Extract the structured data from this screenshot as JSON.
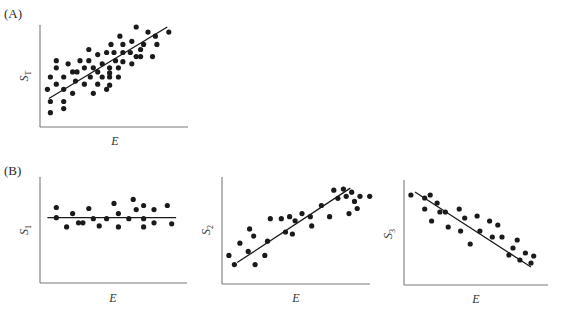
{
  "figure": {
    "panel_A_label": "(A)",
    "panel_B_label": "(B)"
  },
  "chart_data": [
    {
      "type": "scatter",
      "panel": "A",
      "title": "",
      "xlabel": "E",
      "ylabel": "S",
      "ylabel_sub": "T",
      "xlim": [
        0,
        10
      ],
      "ylim": [
        0,
        10
      ],
      "grid": false,
      "fit_line": {
        "x": [
          0.6,
          8.6
        ],
        "y": [
          2.8,
          9.8
        ]
      },
      "points": [
        [
          6.5,
          9.8
        ],
        [
          7.3,
          9.3
        ],
        [
          8.7,
          9.3
        ],
        [
          7.8,
          8.9
        ],
        [
          5.4,
          8.9
        ],
        [
          4.8,
          8.1
        ],
        [
          5.6,
          8.1
        ],
        [
          6.2,
          8.4
        ],
        [
          7.0,
          8.1
        ],
        [
          7.9,
          8.1
        ],
        [
          6.8,
          7.6
        ],
        [
          3.3,
          7.6
        ],
        [
          4.5,
          7.3
        ],
        [
          5.0,
          7.3
        ],
        [
          5.6,
          7.3
        ],
        [
          6.1,
          7.3
        ],
        [
          6.5,
          6.9
        ],
        [
          6.8,
          6.9
        ],
        [
          7.6,
          6.9
        ],
        [
          3.9,
          7.1
        ],
        [
          1.1,
          6.5
        ],
        [
          2.7,
          6.5
        ],
        [
          3.3,
          6.5
        ],
        [
          5.1,
          6.5
        ],
        [
          5.6,
          6.4
        ],
        [
          6.2,
          6.2
        ],
        [
          1.9,
          6.2
        ],
        [
          1.1,
          5.8
        ],
        [
          3.0,
          5.8
        ],
        [
          3.6,
          5.8
        ],
        [
          4.2,
          6.2
        ],
        [
          4.7,
          5.8
        ],
        [
          5.3,
          5.8
        ],
        [
          2.2,
          5.4
        ],
        [
          2.5,
          5.4
        ],
        [
          3.9,
          5.4
        ],
        [
          4.7,
          5.3
        ],
        [
          0.7,
          4.9
        ],
        [
          1.6,
          4.9
        ],
        [
          3.4,
          4.9
        ],
        [
          4.2,
          4.9
        ],
        [
          4.7,
          4.9
        ],
        [
          5.3,
          4.9
        ],
        [
          2.4,
          4.5
        ],
        [
          1.1,
          4.2
        ],
        [
          3.0,
          4.2
        ],
        [
          3.9,
          4.2
        ],
        [
          4.7,
          4.1
        ],
        [
          0.5,
          3.7
        ],
        [
          1.6,
          3.7
        ],
        [
          4.5,
          3.7
        ],
        [
          3.6,
          3.3
        ],
        [
          2.2,
          3.3
        ],
        [
          0.7,
          2.5
        ],
        [
          1.6,
          2.5
        ],
        [
          0.7,
          1.4
        ],
        [
          1.6,
          1.8
        ]
      ]
    },
    {
      "type": "scatter",
      "panel": "B1",
      "title": "",
      "xlabel": "E",
      "ylabel": "S",
      "ylabel_sub": "1",
      "xlim": [
        0,
        10
      ],
      "ylim": [
        0,
        10
      ],
      "grid": false,
      "fit_line": {
        "x": [
          0.5,
          9.2
        ],
        "y": [
          6.4,
          6.4
        ]
      },
      "points": [
        [
          1.1,
          7.4
        ],
        [
          1.1,
          6.4
        ],
        [
          1.8,
          5.5
        ],
        [
          2.2,
          6.8
        ],
        [
          2.6,
          5.9
        ],
        [
          2.9,
          5.9
        ],
        [
          3.3,
          7.3
        ],
        [
          3.6,
          6.3
        ],
        [
          4.0,
          5.6
        ],
        [
          4.5,
          6.3
        ],
        [
          5.0,
          7.8
        ],
        [
          5.3,
          6.8
        ],
        [
          5.3,
          5.5
        ],
        [
          6.0,
          6.3
        ],
        [
          6.3,
          8.2
        ],
        [
          6.5,
          7.2
        ],
        [
          7.0,
          7.6
        ],
        [
          7.0,
          6.3
        ],
        [
          7.0,
          5.5
        ],
        [
          7.7,
          7.2
        ],
        [
          7.7,
          5.9
        ],
        [
          8.6,
          7.6
        ],
        [
          8.9,
          5.8
        ]
      ]
    },
    {
      "type": "scatter",
      "panel": "B2",
      "title": "",
      "xlabel": "E",
      "ylabel": "S",
      "ylabel_sub": "2",
      "xlim": [
        0,
        10
      ],
      "ylim": [
        0,
        10
      ],
      "grid": false,
      "fit_line": {
        "x": [
          1.1,
          9.3
        ],
        "y": [
          2.1,
          9.4
        ]
      },
      "points": [
        [
          0.5,
          2.8
        ],
        [
          0.9,
          1.9
        ],
        [
          1.3,
          4.0
        ],
        [
          1.9,
          3.2
        ],
        [
          2.0,
          5.4
        ],
        [
          2.4,
          1.9
        ],
        [
          2.3,
          4.7
        ],
        [
          3.1,
          2.8
        ],
        [
          3.3,
          4.2
        ],
        [
          3.5,
          6.4
        ],
        [
          4.3,
          6.4
        ],
        [
          4.6,
          5.1
        ],
        [
          4.9,
          6.6
        ],
        [
          5.3,
          6.2
        ],
        [
          5.1,
          4.9
        ],
        [
          5.8,
          6.9
        ],
        [
          6.4,
          6.6
        ],
        [
          6.5,
          5.7
        ],
        [
          7.2,
          7.7
        ],
        [
          7.8,
          6.6
        ],
        [
          8.1,
          9.2
        ],
        [
          8.4,
          8.4
        ],
        [
          9.0,
          8.6
        ],
        [
          9.4,
          9.0
        ],
        [
          9.6,
          8.1
        ],
        [
          9.2,
          6.9
        ],
        [
          10.0,
          8.6
        ],
        [
          9.8,
          7.4
        ],
        [
          10.7,
          8.6
        ],
        [
          8.8,
          9.3
        ]
      ]
    },
    {
      "type": "scatter",
      "panel": "B3",
      "title": "",
      "xlabel": "E",
      "ylabel": "S",
      "ylabel_sub": "3",
      "xlim": [
        0,
        10
      ],
      "ylim": [
        0,
        10
      ],
      "grid": false,
      "fit_line": {
        "x": [
          0.8,
          9.2
        ],
        "y": [
          9.3,
          1.8
        ]
      },
      "points": [
        [
          0.5,
          9.0
        ],
        [
          1.5,
          8.7
        ],
        [
          1.5,
          7.6
        ],
        [
          1.9,
          9.0
        ],
        [
          2.4,
          8.2
        ],
        [
          2.6,
          7.3
        ],
        [
          3.0,
          7.3
        ],
        [
          2.0,
          6.4
        ],
        [
          3.2,
          5.8
        ],
        [
          4.0,
          7.6
        ],
        [
          4.1,
          5.4
        ],
        [
          4.4,
          6.7
        ],
        [
          4.8,
          4.1
        ],
        [
          5.3,
          6.9
        ],
        [
          5.5,
          5.4
        ],
        [
          6.2,
          6.4
        ],
        [
          6.4,
          4.8
        ],
        [
          6.8,
          6.0
        ],
        [
          7.1,
          4.8
        ],
        [
          7.6,
          3.0
        ],
        [
          7.9,
          3.7
        ],
        [
          8.2,
          4.5
        ],
        [
          8.8,
          3.2
        ],
        [
          9.2,
          2.2
        ],
        [
          9.4,
          2.9
        ],
        [
          8.4,
          2.5
        ]
      ]
    }
  ]
}
